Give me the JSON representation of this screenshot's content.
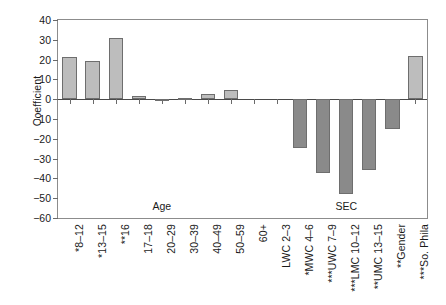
{
  "chart_data": {
    "type": "bar",
    "title": "",
    "subtitle": "",
    "xlabel": "",
    "ylabel": "Coefficient",
    "ylim": [
      -60,
      40
    ],
    "yticks": [
      40,
      30,
      20,
      10,
      0,
      -10,
      -20,
      -30,
      -40,
      -50,
      -60
    ],
    "ytick_labels": [
      "40",
      "30",
      "20",
      "10",
      "0",
      "−10",
      "−20",
      "−30",
      "−40",
      "−50",
      "−60"
    ],
    "grid": false,
    "legend": false,
    "legend_position": "none",
    "group_labels": [
      "Age",
      "SEC"
    ],
    "categories": [
      "*8–12",
      "*13–15",
      "**16",
      "17–18",
      "20–29",
      "30–39",
      "40–49",
      "50–59",
      "60+",
      "LWC 2–3",
      "*MWC 4–6",
      "***UWC 7–9",
      "***LMC 10–12",
      "**UMC 13–15",
      "**Gender",
      "***So. Phila"
    ],
    "values": [
      21.5,
      19.5,
      31.0,
      1.5,
      -0.6,
      0.8,
      2.4,
      4.4,
      0.0,
      0.0,
      -24.5,
      -37.5,
      -48.0,
      -36.0,
      -15.0,
      22.0
    ],
    "bar_colors": {
      "positive": "#bdbdbd",
      "negative": "#8a8a8a",
      "edge": "#6e6e6e"
    },
    "axis_color": "#8c8c8c",
    "zero_line_color": "#4a4a4a"
  },
  "axes": {
    "ylabel": "Coefficient"
  },
  "groups": [
    {
      "label": "Age",
      "center_index": 4
    },
    {
      "label": "SEC",
      "center_index": 12
    }
  ]
}
